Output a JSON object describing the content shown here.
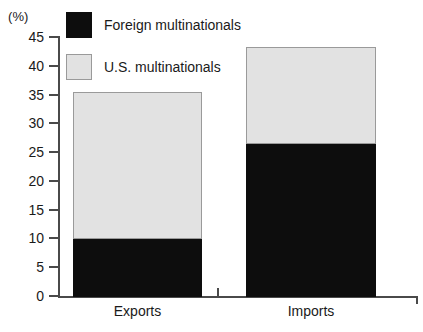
{
  "chart_data": {
    "type": "bar",
    "subtype": "stacked-bar",
    "title": "",
    "xlabel": "",
    "ylabel": "(%)",
    "categories": [
      "Exports",
      "Imports"
    ],
    "series": [
      {
        "name": "Foreign multinationals",
        "color": "#0d0d0d",
        "values": [
          10.1,
          26.5
        ]
      },
      {
        "name": "U.S. multinationals",
        "color": "#e2e2e2",
        "values": [
          25.6,
          17.0
        ]
      }
    ],
    "totals": [
      35.7,
      43.5
    ],
    "ylim": [
      0,
      45
    ],
    "yticks": [
      0,
      5,
      10,
      15,
      20,
      25,
      30,
      35,
      40,
      45
    ],
    "ytick_labels": [
      "0",
      "5",
      "10",
      "15",
      "20",
      "25",
      "30",
      "35",
      "40",
      "45"
    ],
    "grid": false,
    "legend_position": "top-left-inside",
    "stack_order": "bottom-to-top"
  },
  "axis": {
    "unit_label": "(%)",
    "tick_labels": [
      "45",
      "40",
      "35",
      "30",
      "25",
      "20",
      "15",
      "10",
      "5",
      "0"
    ]
  },
  "legend": {
    "items": [
      {
        "label": "Foreign multinationals",
        "swatch": "dark"
      },
      {
        "label": "U.S. multinationals",
        "swatch": "light"
      }
    ]
  },
  "categories": [
    {
      "label": "Exports"
    },
    {
      "label": "Imports"
    }
  ],
  "colors": {
    "dark": "#0d0d0d",
    "light": "#e2e2e2",
    "light_border": "#9a9a9a",
    "axis": "#4a4a4a",
    "text": "#1a1a1a",
    "background": "#ffffff"
  }
}
